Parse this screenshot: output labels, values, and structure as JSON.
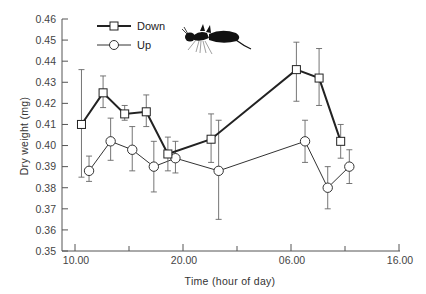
{
  "chart_data": {
    "type": "line",
    "title": "",
    "xlabel": "Time (hour of day)",
    "ylabel": "Dry weight (mg)",
    "ylim": [
      0.35,
      0.46
    ],
    "yticks": [
      "0.35",
      "0.36",
      "0.37",
      "0.38",
      "0.39",
      "0.40",
      "0.41",
      "0.42",
      "0.43",
      "0.44",
      "0.45",
      "0.46"
    ],
    "xlim_hours": [
      8.8,
      46
    ],
    "xticks": [
      {
        "hour": 10,
        "label": "10.00",
        "major": true
      },
      {
        "hour": 15,
        "label": "",
        "major": false
      },
      {
        "hour": 20,
        "label": "20.00",
        "major": true
      },
      {
        "hour": 25,
        "label": "",
        "major": false
      },
      {
        "hour": 30,
        "label": "06.00",
        "major": true
      },
      {
        "hour": 35,
        "label": "",
        "major": false
      },
      {
        "hour": 40,
        "label": "16.00",
        "major": true
      }
    ],
    "grid": false,
    "legend_position": "upper-left",
    "annotation": "ant silhouette icon",
    "series": [
      {
        "name": "Down",
        "marker": "square",
        "x": [
          10.6,
          12.6,
          14.6,
          16.6,
          18.6,
          22.6,
          30.5,
          32.6,
          34.6
        ],
        "values": [
          0.41,
          0.425,
          0.415,
          0.416,
          0.396,
          0.403,
          0.436,
          0.432,
          0.402
        ],
        "err_low": [
          0.385,
          0.418,
          0.412,
          0.409,
          0.388,
          0.392,
          0.421,
          0.419,
          0.394
        ],
        "err_high": [
          0.436,
          0.433,
          0.419,
          0.424,
          0.404,
          0.415,
          0.449,
          0.446,
          0.41
        ]
      },
      {
        "name": "Up",
        "marker": "circle",
        "x": [
          11.3,
          13.3,
          15.3,
          17.3,
          19.3,
          23.3,
          31.3,
          33.4,
          35.4
        ],
        "values": [
          0.388,
          0.402,
          0.398,
          0.39,
          0.394,
          0.388,
          0.402,
          0.38,
          0.39
        ],
        "err_low": [
          0.383,
          0.393,
          0.388,
          0.378,
          0.387,
          0.365,
          0.392,
          0.37,
          0.382
        ],
        "err_high": [
          0.395,
          0.413,
          0.409,
          0.402,
          0.402,
          0.412,
          0.412,
          0.39,
          0.398
        ]
      }
    ]
  },
  "legend": {
    "items": [
      {
        "label": "Down",
        "marker": "square"
      },
      {
        "label": "Up",
        "marker": "circle"
      }
    ]
  },
  "icons": {
    "ant": "ant-silhouette-icon"
  }
}
